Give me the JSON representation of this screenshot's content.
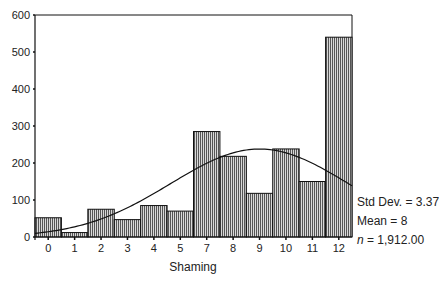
{
  "chart_data": {
    "type": "bar",
    "subtype": "histogram_with_normal_curve",
    "title": "",
    "xlabel": "Shaming",
    "ylabel": "",
    "categories": [
      "0",
      "1",
      "2",
      "3",
      "4",
      "5",
      "7",
      "8",
      "9",
      "10",
      "11",
      "12"
    ],
    "values": [
      52,
      12,
      75,
      47,
      85,
      70,
      285,
      218,
      118,
      238,
      150,
      540
    ],
    "ylim": [
      0,
      600
    ],
    "yticks": [
      0,
      100,
      200,
      300,
      400,
      500,
      600
    ],
    "grid": false,
    "legend": null,
    "bar_fill": "#888888",
    "bar_pattern": "vertical-hatch",
    "overlay": {
      "type": "normal_curve",
      "mean": 8,
      "std_dev": 3.37
    },
    "annotations": {
      "std_dev": "Std Dev. = 3.37",
      "mean": "Mean = 8",
      "n_prefix": "n",
      "n_value": " = 1,912.00"
    }
  }
}
